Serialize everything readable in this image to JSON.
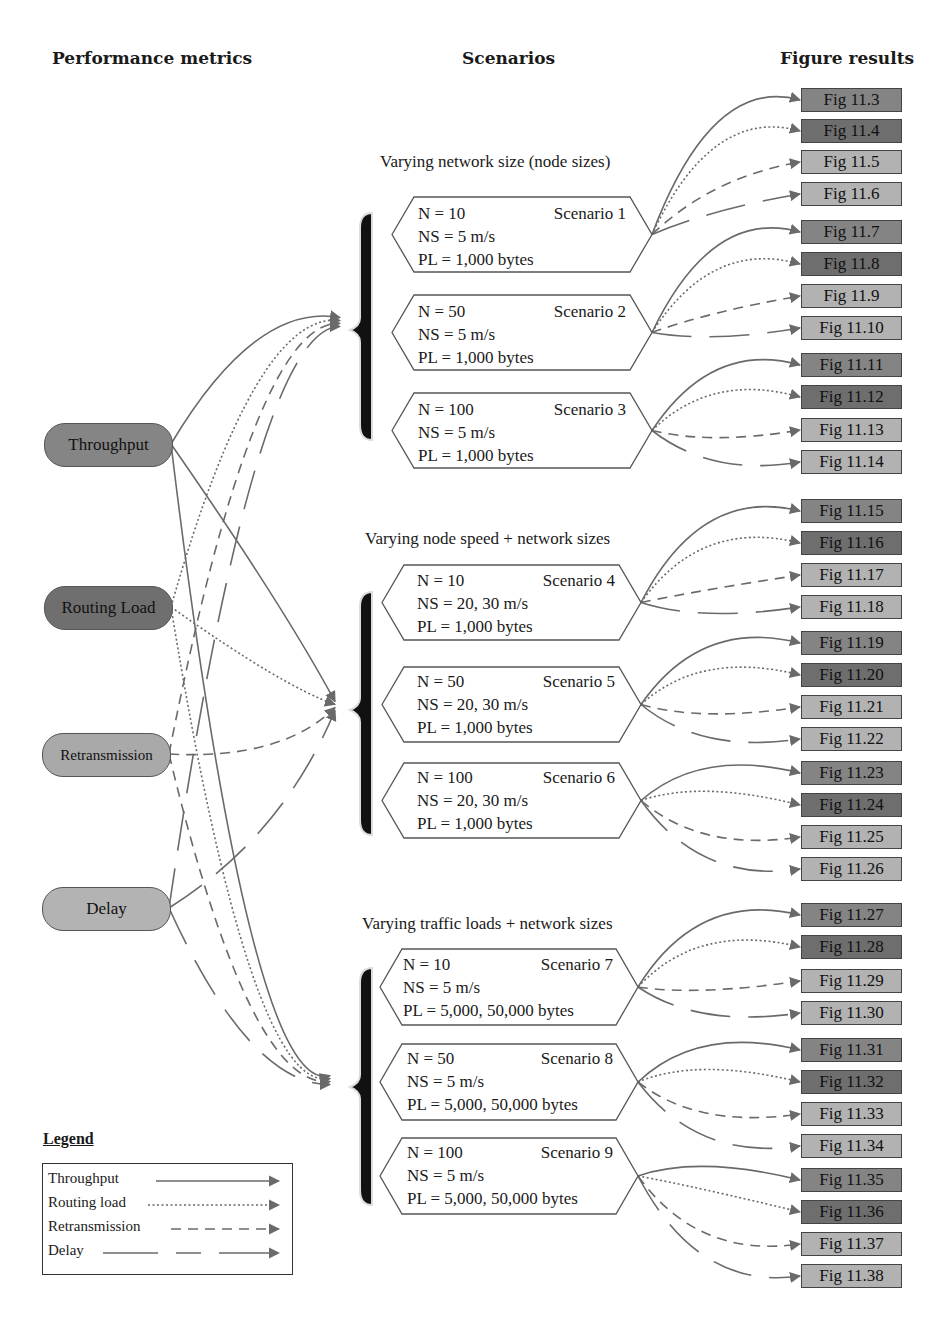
{
  "headers": {
    "metrics": "Performance metrics",
    "scenarios": "Scenarios",
    "results": "Figure results"
  },
  "metrics": [
    {
      "label": "Throughput",
      "color": "#858585"
    },
    {
      "label": "Routing Load",
      "color": "#6f6f6f"
    },
    {
      "label": "Retransmission",
      "color": "#a9a9a9"
    },
    {
      "label": "Delay",
      "color": "#b3b3b3"
    }
  ],
  "groups": [
    {
      "title": "Varying network size (node sizes)"
    },
    {
      "title": "Varying node speed + network sizes"
    },
    {
      "title": "Varying traffic loads + network sizes"
    }
  ],
  "scenarios": [
    {
      "n": "N = 10",
      "name": "Scenario 1",
      "ns": "NS = 5 m/s",
      "pl": "PL = 1,000 bytes"
    },
    {
      "n": "N = 50",
      "name": "Scenario 2",
      "ns": "NS = 5 m/s",
      "pl": "PL = 1,000 bytes"
    },
    {
      "n": "N = 100",
      "name": "Scenario 3",
      "ns": "NS = 5 m/s",
      "pl": "PL = 1,000 bytes"
    },
    {
      "n": "N = 10",
      "name": "Scenario 4",
      "ns": "NS = 20, 30 m/s",
      "pl": "PL = 1,000 bytes"
    },
    {
      "n": "N = 50",
      "name": "Scenario 5",
      "ns": "NS = 20, 30 m/s",
      "pl": "PL = 1,000 bytes"
    },
    {
      "n": "N = 100",
      "name": "Scenario 6",
      "ns": "NS = 20, 30 m/s",
      "pl": "PL = 1,000 bytes"
    },
    {
      "n": "N = 10",
      "name": "Scenario 7",
      "ns": "NS = 5 m/s",
      "pl": "PL = 5,000, 50,000 bytes"
    },
    {
      "n": "N = 50",
      "name": "Scenario 8",
      "ns": "NS = 5 m/s",
      "pl": "PL = 5,000, 50,000 bytes"
    },
    {
      "n": "N = 100",
      "name": "Scenario 9",
      "ns": "NS = 5 m/s",
      "pl": "PL = 5,000, 50,000 bytes"
    }
  ],
  "figures": [
    "Fig 11.3",
    "Fig 11.4",
    "Fig 11.5",
    "Fig 11.6",
    "Fig 11.7",
    "Fig 11.8",
    "Fig 11.9",
    "Fig 11.10",
    "Fig 11.11",
    "Fig 11.12",
    "Fig 11.13",
    "Fig 11.14",
    "Fig 11.15",
    "Fig 11.16",
    "Fig 11.17",
    "Fig 11.18",
    "Fig 11.19",
    "Fig 11.20",
    "Fig 11.21",
    "Fig 11.22",
    "Fig 11.23",
    "Fig 11.24",
    "Fig 11.25",
    "Fig 11.26",
    "Fig 11.27",
    "Fig 11.28",
    "Fig 11.29",
    "Fig 11.30",
    "Fig 11.31",
    "Fig 11.32",
    "Fig 11.33",
    "Fig 11.34",
    "Fig 11.35",
    "Fig 11.36",
    "Fig 11.37",
    "Fig 11.38"
  ],
  "figure_colors": {
    "throughput": "#848484",
    "routing_load": "#6e6e6e",
    "retransmission": "#b2b2b2",
    "delay": "#b2b2b2"
  },
  "legend": {
    "title": "Legend",
    "items": [
      "Throughput",
      "Routing load",
      "Retransmission",
      "Delay"
    ]
  },
  "line_color": "#6a6a6a"
}
